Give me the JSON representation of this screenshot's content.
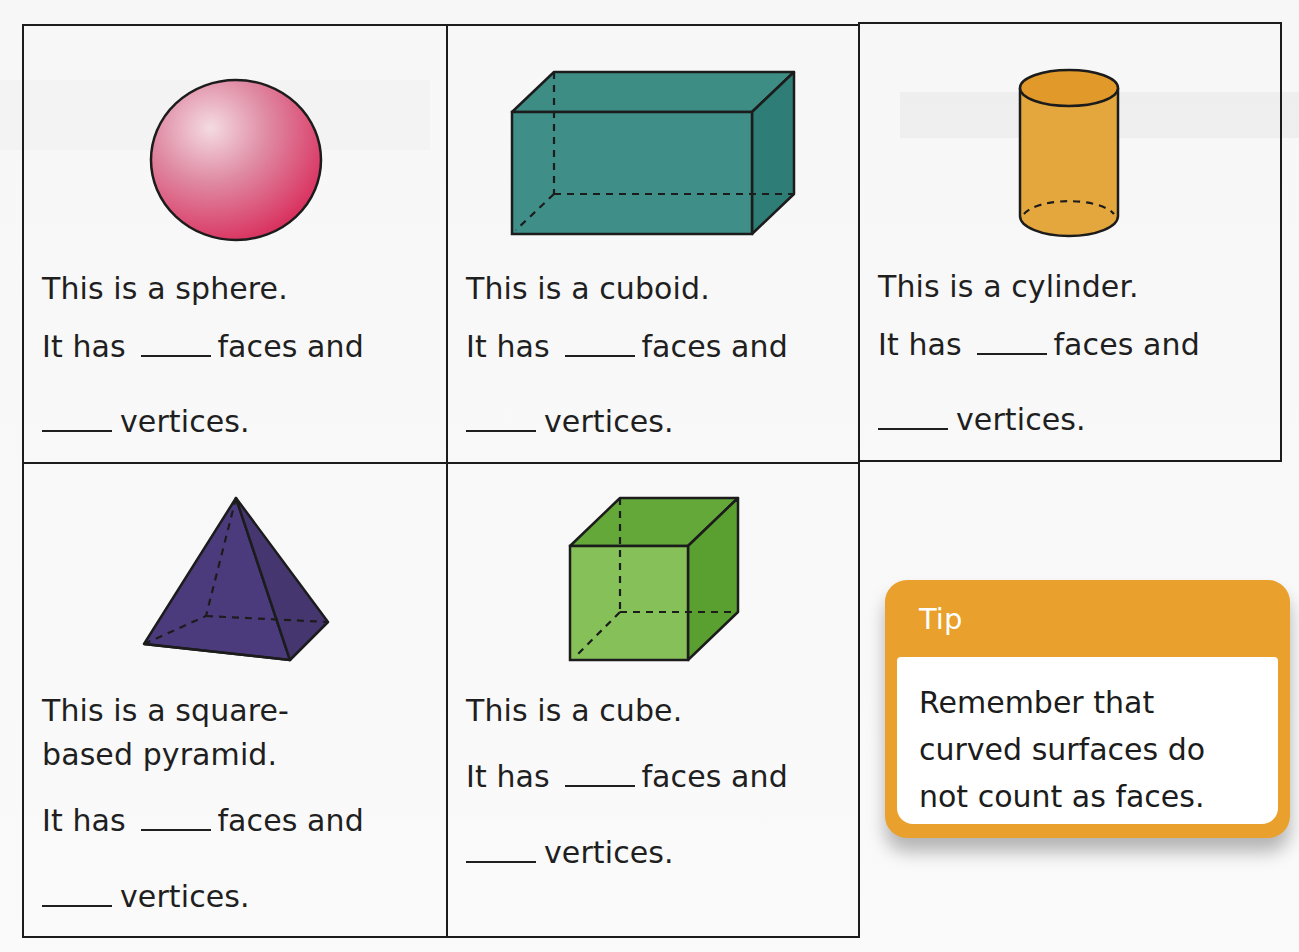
{
  "colors": {
    "border": "#1c1c1c",
    "sphere": "#d9466a",
    "cuboid": "#3f8f88",
    "cylinder": "#e2a63c",
    "pyramid": "#4a3a78",
    "cube": "#74b64a",
    "tip_accent": "#e9a02d"
  },
  "cells": [
    {
      "shape": "sphere",
      "lines": [
        "This is a sphere."
      ],
      "faces_prefix": "It has",
      "faces_suffix": "faces and",
      "vertices_suffix": "vertices."
    },
    {
      "shape": "cuboid",
      "lines": [
        "This is a cuboid."
      ],
      "faces_prefix": "It has",
      "faces_suffix": "faces and",
      "vertices_suffix": "vertices."
    },
    {
      "shape": "cylinder",
      "lines": [
        "This is a cylinder."
      ],
      "faces_prefix": "It has",
      "faces_suffix": "faces and",
      "vertices_suffix": "vertices."
    },
    {
      "shape": "square-based pyramid",
      "lines": [
        "This is a square-",
        "based pyramid."
      ],
      "faces_prefix": "It has",
      "faces_suffix": "faces and",
      "vertices_suffix": "vertices."
    },
    {
      "shape": "cube",
      "lines": [
        "This is a cube."
      ],
      "faces_prefix": "It has",
      "faces_suffix": "faces and",
      "vertices_suffix": "vertices."
    }
  ],
  "tip": {
    "title": "Tip",
    "lines": [
      "Remember that",
      "curved surfaces do",
      "not count as faces."
    ]
  }
}
